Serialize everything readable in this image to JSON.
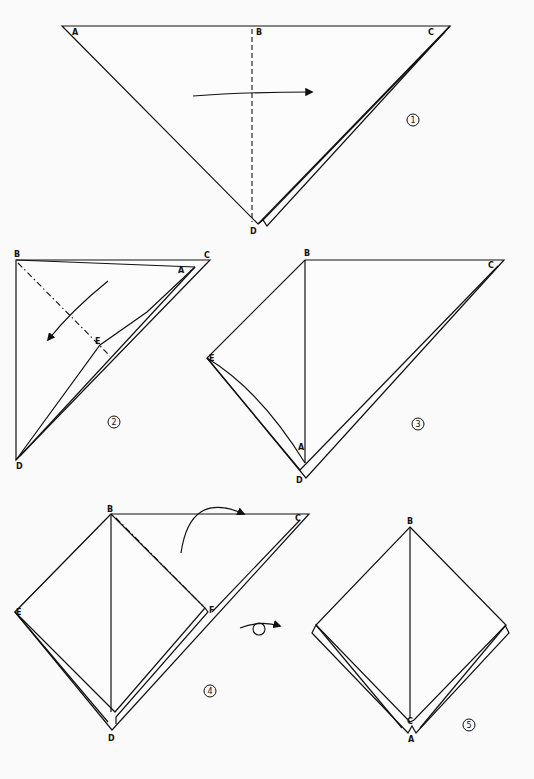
{
  "colors": {
    "paper": "#fcfcfc",
    "line": "#111111",
    "background": "#fafafa"
  },
  "steps": [
    {
      "number": "1",
      "labels": {
        "A": "A",
        "B": "B",
        "C": "C",
        "D": "D"
      },
      "fold": "valley-fold along B-D, fold left half over to the right"
    },
    {
      "number": "2",
      "labels": {
        "A": "A",
        "B": "B",
        "C": "C",
        "D": "D",
        "E": "E"
      },
      "fold": "mountain-fold along B-E line, fold down-left"
    },
    {
      "number": "3",
      "labels": {
        "A": "A",
        "B": "B",
        "C": "C",
        "D": "D",
        "E": "E"
      }
    },
    {
      "number": "4",
      "labels": {
        "B": "B",
        "C": "C",
        "D": "D",
        "E": "E",
        "F": "F"
      },
      "fold": "mountain-fold along B-F, fold C behind"
    },
    {
      "number": "5",
      "labels": {
        "A": "A",
        "B": "B",
        "C": "C"
      }
    }
  ],
  "turn_over_symbol": "turn-over-arrow"
}
